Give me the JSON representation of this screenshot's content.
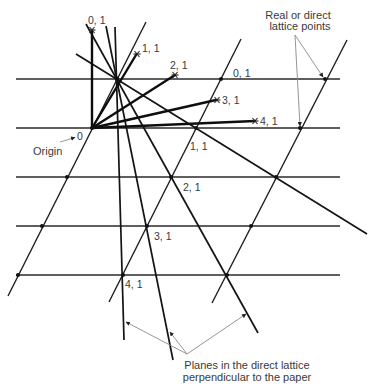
{
  "diagram": {
    "origin": {
      "symbol": "0",
      "caption": "Origin"
    },
    "reciprocal_points": [
      {
        "label": "0, 1"
      },
      {
        "label": "1, 1"
      },
      {
        "label": "2, 1"
      },
      {
        "label": "3, 1"
      },
      {
        "label": "4, 1"
      }
    ],
    "direct_lattice_plane_labels": [
      {
        "label": "0, 1"
      },
      {
        "label": "1, 1"
      },
      {
        "label": "2, 1"
      },
      {
        "label": "3, 1"
      },
      {
        "label": "4, 1"
      }
    ],
    "annotations": {
      "real_lattice": {
        "line1": "Real or direct",
        "line2": "lattice points"
      },
      "planes": {
        "line1": "Planes in the direct lattice",
        "line2": "perpendicular to the paper"
      }
    },
    "structure": {
      "horizontal_lattice_rows": 5,
      "slanted_lattice_rows": 3,
      "plane_lines_through_common_point": 4,
      "reciprocal_vectors_from_origin": 5,
      "marked_lattice_points": 15
    }
  }
}
